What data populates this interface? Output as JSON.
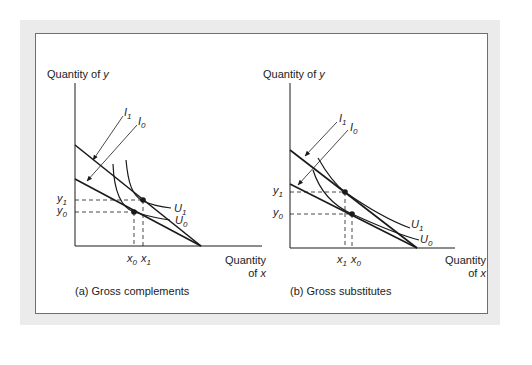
{
  "figure": {
    "panels": [
      {
        "id": "a",
        "caption": "(a) Gross complements",
        "y_axis_label": "Quantity of",
        "y_axis_var": "y",
        "x_axis_label_line1": "Quantity",
        "x_axis_label_line2": "of",
        "x_axis_var": "x",
        "budget_lines": [
          {
            "name": "I",
            "sub": "1"
          },
          {
            "name": "I",
            "sub": "0"
          }
        ],
        "indifference_curves": [
          {
            "name": "U",
            "sub": "1"
          },
          {
            "name": "U",
            "sub": "0"
          }
        ],
        "y_ticks": [
          {
            "name": "y",
            "sub": "1"
          },
          {
            "name": "y",
            "sub": "0"
          }
        ],
        "x_ticks": [
          {
            "name": "x",
            "sub": "0"
          },
          {
            "name": "x",
            "sub": "1"
          }
        ]
      },
      {
        "id": "b",
        "caption": "(b) Gross substitutes",
        "y_axis_label": "Quantity of",
        "y_axis_var": "y",
        "x_axis_label_line1": "Quantity",
        "x_axis_label_line2": "of",
        "x_axis_var": "x",
        "budget_lines": [
          {
            "name": "I",
            "sub": "1"
          },
          {
            "name": "I",
            "sub": "0"
          }
        ],
        "indifference_curves": [
          {
            "name": "U",
            "sub": "1"
          },
          {
            "name": "U",
            "sub": "0"
          }
        ],
        "y_ticks": [
          {
            "name": "y",
            "sub": "1"
          },
          {
            "name": "y",
            "sub": "0"
          }
        ],
        "x_ticks": [
          {
            "name": "x",
            "sub": "1"
          },
          {
            "name": "x",
            "sub": "0"
          }
        ]
      }
    ],
    "colors": {
      "line": "#1a1a1a",
      "frame": "#6f6f6f",
      "outer_band": "#ebebeb"
    }
  }
}
